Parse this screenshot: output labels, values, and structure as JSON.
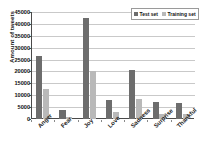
{
  "chart_data": {
    "type": "bar",
    "title": "",
    "xlabel": "",
    "ylabel": "Amount of tweets",
    "ylim": [
      0,
      45000
    ],
    "ytick_step": 5000,
    "yticks": [
      "45000",
      "40000",
      "35000",
      "30000",
      "25000",
      "20000",
      "15000",
      "10000",
      "5000",
      "0"
    ],
    "grid": true,
    "legend_position": "top-right",
    "categories": [
      "Anger",
      "Fear",
      "Joy",
      "Love",
      "Sadness",
      "Surprise",
      "Thankful"
    ],
    "series": [
      {
        "name": "Test set",
        "color": "#6d6d6d",
        "values": [
          26500,
          3600,
          42500,
          7800,
          20700,
          7200,
          6900
        ]
      },
      {
        "name": "Training set",
        "color": "#b9b9b9",
        "values": [
          12800,
          700,
          20200,
          2900,
          8500,
          1900,
          2300
        ]
      }
    ]
  },
  "legend": {
    "items": [
      {
        "label": "Test set",
        "color": "#6d6d6d"
      },
      {
        "label": "Training set",
        "color": "#b9b9b9"
      }
    ]
  },
  "axes": {
    "y_title": "Amount of tweets"
  }
}
